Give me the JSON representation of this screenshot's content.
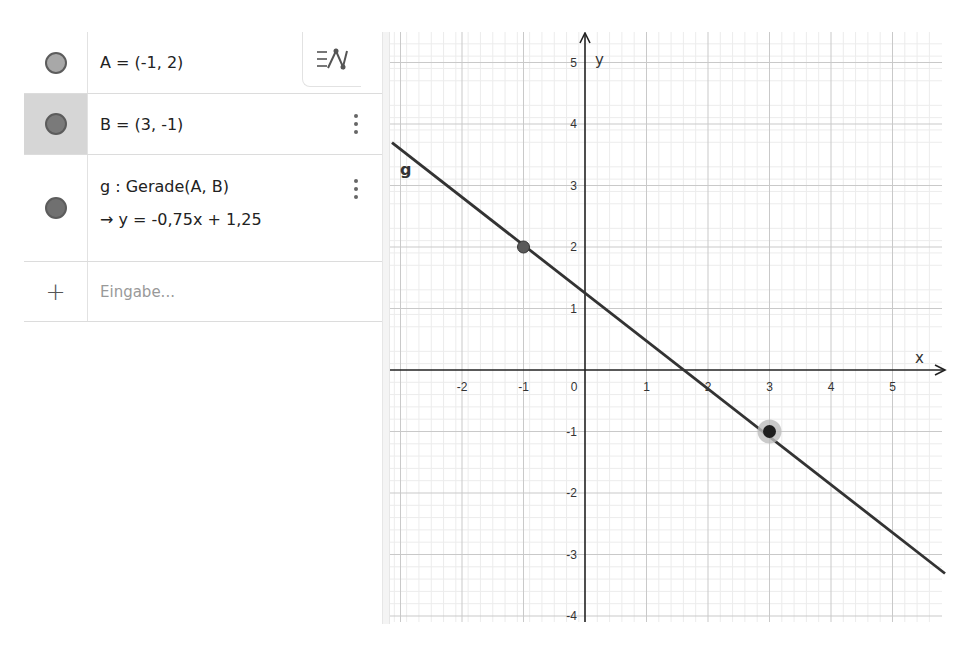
{
  "algebra_view": {
    "items": [
      {
        "id": "A",
        "definition": "A = (-1, 2)",
        "marble_color": "#a8a8a8",
        "selected": false
      },
      {
        "id": "B",
        "definition": "B = (3, -1)",
        "marble_color": "#7a7a7a",
        "selected": true
      },
      {
        "id": "g",
        "definition": "g : Gerade(A, B)",
        "output": "→ y = -0,75x + 1,25",
        "marble_color": "#707070",
        "selected": false
      }
    ],
    "input": {
      "icon": "plus-icon",
      "placeholder": "Eingabe..."
    },
    "style_toggle_icon": "algebra-description-toggle-icon"
  },
  "graphics_view": {
    "axis_labels": {
      "x": "x",
      "y": "y"
    },
    "x_ticks": [
      "-2",
      "-1",
      "0",
      "1",
      "2",
      "3",
      "4",
      "5"
    ],
    "y_ticks": [
      "5",
      "4",
      "3",
      "2",
      "1",
      "-1",
      "-2",
      "-3",
      "-4"
    ],
    "line_label": "g",
    "points": [
      {
        "name": "A",
        "x": -1,
        "y": 2,
        "color": "#555555"
      },
      {
        "name": "B",
        "x": 3,
        "y": -1,
        "color": "#222222",
        "highlighted": true
      }
    ],
    "line": {
      "name": "g",
      "slope": -0.75,
      "intercept": 1.25,
      "color": "#333333"
    }
  }
}
